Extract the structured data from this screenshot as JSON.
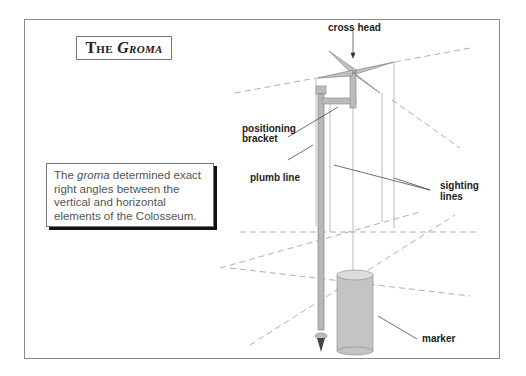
{
  "title": {
    "prefix": "The ",
    "name": "Groma"
  },
  "note": {
    "pre": "The ",
    "italic": "groma",
    "post": " determined exact right angles between the vertical and horizontal elements of the Colosseum."
  },
  "labels": {
    "cross_head": "cross head",
    "positioning_bracket_1": "positioning",
    "positioning_bracket_2": "bracket",
    "plumb_line": "plumb line",
    "sighting_lines_1": "sighting",
    "sighting_lines_2": "lines",
    "marker": "marker"
  },
  "colors": {
    "border": "#8a8a8a",
    "pole": "#b8b8b8",
    "marker": "#c4c4c4",
    "dashed": "#999999",
    "text": "#222222",
    "note_text": "#555555"
  }
}
